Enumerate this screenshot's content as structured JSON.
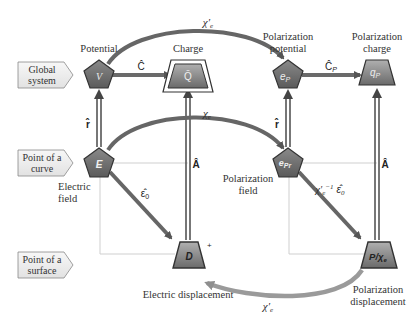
{
  "diagram": {
    "rows": [
      {
        "label_line1": "Global",
        "label_line2": "system"
      },
      {
        "label_line1": "Point of a",
        "label_line2": "curve"
      },
      {
        "label_line1": "Point of a",
        "label_line2": "surface"
      }
    ],
    "nodes": {
      "potential": {
        "title": "Potential",
        "symbol": "V"
      },
      "charge": {
        "title": "Charge",
        "symbol": "Q̄"
      },
      "polarization_potential": {
        "title_line1": "Polarization",
        "title_line2": "potential",
        "symbol": "e",
        "sub": "P"
      },
      "polarization_charge": {
        "title_line1": "Polarization",
        "title_line2": "charge",
        "symbol": "q",
        "sub": "P"
      },
      "electric_field": {
        "title_line1": "Electric",
        "title_line2": "field",
        "symbol": "E"
      },
      "polarization_field": {
        "title_line1": "Polarization",
        "title_line2": "field",
        "symbol": "e",
        "sub": "Pr"
      },
      "electric_displacement": {
        "title": "Electric displacement",
        "symbol": "D",
        "mark": "+"
      },
      "polarization_displacement": {
        "title_line1": "Polarization",
        "title_line2": "displacement",
        "symbol": "P/χ",
        "sub": "e"
      }
    },
    "edges": {
      "C_hat": "Ĉ",
      "C_P_hat": "Ĉ",
      "C_P_sub": "P",
      "r_hat_left": "r̂",
      "r_hat_right": "r̂",
      "A_hat_left": "Â",
      "A_hat_right": "Â",
      "chi_e_prime_top": "χ′",
      "chi_e_prime_top_sub": "e",
      "chi_e_middle": "χ",
      "chi_e_middle_sub": "e",
      "eps0_hat": "ε̂",
      "eps0_sub": "0",
      "chi_inv_eps": "χ′",
      "chi_inv_sub": "e",
      "chi_inv_sup": "−1",
      "chi_inv_eps_sym": "ε̂",
      "chi_inv_eps_sub": "0",
      "chi_e_prime_bottom": "χ′",
      "chi_e_prime_bottom_sub": "e"
    },
    "colors": {
      "node_fill_dark": "#6f6f6f",
      "node_fill_light": "#a9a9a9",
      "arrow_dark": "#666666",
      "arrow_light": "#9a9a9a",
      "grid_line": "#cccccc",
      "label_box_fill": "#eeeeee"
    }
  }
}
